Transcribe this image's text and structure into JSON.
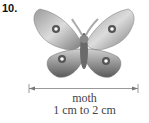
{
  "figure": {
    "number": "10.",
    "subject": "moth",
    "size_range": "1 cm to 2 cm",
    "icon": "moth-illustration"
  }
}
